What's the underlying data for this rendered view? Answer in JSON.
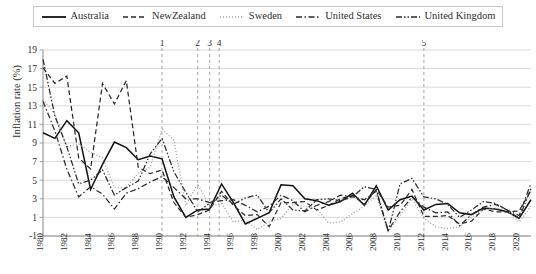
{
  "chart_data": {
    "type": "line",
    "title": "",
    "xlabel": "",
    "ylabel": "Inflation rate (%)",
    "ylim": [
      -1,
      19
    ],
    "ytick_values": [
      -1,
      1,
      3,
      5,
      7,
      9,
      11,
      13,
      15,
      17,
      19
    ],
    "ytick_labels": [
      "-1",
      "1",
      "3",
      "5",
      "7",
      "9",
      "11",
      "13",
      "15",
      "17",
      "19"
    ],
    "xlim": [
      1980,
      2021
    ],
    "xtick_values": [
      1980,
      1982,
      1984,
      1986,
      1988,
      1990,
      1992,
      1994,
      1996,
      1998,
      2000,
      2002,
      2004,
      2006,
      2008,
      2010,
      2012,
      2014,
      2016,
      2018,
      2020
    ],
    "xtick_labels": [
      "1980",
      "1982",
      "1984",
      "1986",
      "1988",
      "1990",
      "1992",
      "1994",
      "1996",
      "1998",
      "2000",
      "2002",
      "2004",
      "2006",
      "2008",
      "2010",
      "2012",
      "2014",
      "2016",
      "2018",
      "2020"
    ],
    "grid": true,
    "legend_position": "top",
    "x": [
      1980,
      1981,
      1982,
      1983,
      1984,
      1985,
      1986,
      1987,
      1988,
      1989,
      1990,
      1991,
      1992,
      1993,
      1994,
      1995,
      1996,
      1997,
      1998,
      1999,
      2000,
      2001,
      2002,
      2003,
      2004,
      2005,
      2006,
      2007,
      2008,
      2009,
      2010,
      2011,
      2012,
      2013,
      2014,
      2015,
      2016,
      2017,
      2018,
      2019,
      2020,
      2021
    ],
    "series": [
      {
        "name": "Australia",
        "style": "solid",
        "values": [
          10.1,
          9.5,
          11.4,
          10.1,
          4.0,
          6.7,
          9.1,
          8.5,
          7.2,
          7.6,
          7.3,
          3.2,
          1.0,
          1.8,
          1.9,
          4.6,
          2.6,
          0.3,
          0.9,
          1.5,
          4.5,
          4.4,
          3.0,
          2.8,
          2.3,
          2.7,
          3.6,
          2.3,
          4.4,
          1.8,
          2.9,
          3.3,
          1.8,
          2.4,
          2.5,
          1.5,
          1.3,
          2.0,
          1.9,
          1.6,
          0.9,
          2.9
        ]
      },
      {
        "name": "NewZealand",
        "style": "dashed",
        "values": [
          17.1,
          15.4,
          16.2,
          7.4,
          6.2,
          15.4,
          13.2,
          15.7,
          6.4,
          5.7,
          6.1,
          2.6,
          1.0,
          1.3,
          1.8,
          3.8,
          2.3,
          1.2,
          1.3,
          0.0,
          2.6,
          2.6,
          2.7,
          1.8,
          2.3,
          3.0,
          3.4,
          2.4,
          4.0,
          2.1,
          2.3,
          4.0,
          1.1,
          1.1,
          1.2,
          0.3,
          0.6,
          1.9,
          1.6,
          1.6,
          1.7,
          3.9
        ]
      },
      {
        "name": "Sweden",
        "style": "dotted",
        "values": [
          13.7,
          12.1,
          8.6,
          8.9,
          8.0,
          7.4,
          4.2,
          4.2,
          5.8,
          6.4,
          10.5,
          9.3,
          2.3,
          4.6,
          2.2,
          2.5,
          0.5,
          0.7,
          -0.3,
          0.5,
          0.9,
          2.4,
          2.2,
          1.9,
          0.4,
          0.5,
          1.4,
          2.2,
          3.4,
          -0.5,
          1.2,
          3.0,
          0.9,
          0.0,
          -0.2,
          0.0,
          1.0,
          1.8,
          2.0,
          1.8,
          0.5,
          2.2
        ]
      },
      {
        "name": "United States",
        "style": "dashdot",
        "values": [
          13.5,
          10.3,
          6.2,
          3.2,
          4.3,
          3.5,
          1.9,
          3.6,
          4.1,
          4.8,
          5.4,
          4.2,
          3.0,
          3.0,
          2.6,
          2.8,
          2.9,
          2.3,
          1.6,
          2.2,
          3.4,
          2.8,
          1.6,
          2.3,
          2.7,
          3.4,
          3.2,
          2.9,
          3.8,
          -0.4,
          1.6,
          3.2,
          2.1,
          1.5,
          1.6,
          0.1,
          1.3,
          2.1,
          2.4,
          1.8,
          1.2,
          4.7
        ]
      },
      {
        "name": "United Kingdom",
        "style": "dashdotdot",
        "values": [
          18.0,
          11.9,
          8.6,
          4.6,
          5.0,
          6.1,
          3.4,
          4.2,
          4.9,
          7.8,
          9.5,
          5.9,
          3.7,
          1.6,
          2.5,
          3.4,
          2.4,
          3.1,
          3.4,
          1.5,
          3.0,
          1.8,
          1.7,
          2.9,
          3.0,
          2.8,
          3.2,
          4.3,
          4.0,
          -0.5,
          4.6,
          5.2,
          3.2,
          3.0,
          2.4,
          1.0,
          1.8,
          2.7,
          2.5,
          1.8,
          0.9,
          4.1
        ]
      }
    ],
    "annotations": [
      {
        "label": "1",
        "x": 1990
      },
      {
        "label": "2",
        "x": 1993
      },
      {
        "label": "3",
        "x": 1994
      },
      {
        "label": "4",
        "x": 1994.8
      },
      {
        "label": "5",
        "x": 2012
      }
    ]
  },
  "legend": {
    "items": [
      {
        "label": "Australia",
        "key": "line-solid-icon"
      },
      {
        "label": "NewZealand",
        "key": "line-dashed-icon"
      },
      {
        "label": "Sweden",
        "key": "line-dotted-icon"
      },
      {
        "label": "United States",
        "key": "line-dashdot-icon"
      },
      {
        "label": "United Kingdom",
        "key": "line-dashdotdot-icon"
      }
    ]
  }
}
